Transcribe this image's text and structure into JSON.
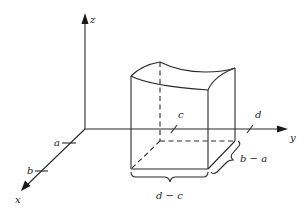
{
  "figure": {
    "type": "3d-solid-over-rectangle"
  },
  "axes": {
    "x": {
      "label": "x"
    },
    "y": {
      "label": "y"
    },
    "z": {
      "label": "z"
    }
  },
  "ticks": {
    "x": [
      {
        "label": "a"
      },
      {
        "label": "b"
      }
    ],
    "y": [
      {
        "label": "c"
      },
      {
        "label": "d"
      }
    ]
  },
  "dimensions": {
    "width_brace": "d − c",
    "depth_brace": "b − a"
  },
  "colors": {
    "stroke": "#2a2a2a",
    "background": "#ffffff"
  }
}
